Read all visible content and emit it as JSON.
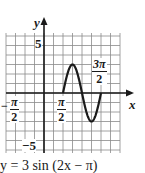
{
  "chart_data": {
    "type": "line",
    "title": "y = 3 sin (2x − π)",
    "xlabel": "x",
    "ylabel": "y",
    "function": "3*sin(2*x - pi)",
    "domain_plotted": [
      "π/2",
      "3π/2"
    ],
    "xlim": [
      "-3π/4",
      "9π/4"
    ],
    "ylim": [
      -6,
      6.5
    ],
    "grid": true,
    "grid_step_x": "π/4",
    "grid_step_y": 1,
    "x_tick_labels": [
      "-π/2",
      "π/2",
      "3π/2"
    ],
    "y_tick_labels": [
      "5",
      "-5"
    ],
    "points": [
      {
        "x": "π/2",
        "y": 0
      },
      {
        "x": "3π/4",
        "y": 3
      },
      {
        "x": "π",
        "y": 0
      },
      {
        "x": "5π/4",
        "y": -3
      },
      {
        "x": "3π/2",
        "y": 0
      }
    ],
    "amplitude": 3,
    "period": "π",
    "phase_shift": "π/2"
  },
  "axes": {
    "x_label": "x",
    "y_label": "y",
    "y_tick_pos": "5",
    "y_tick_neg": "−5",
    "x_tick_neg": {
      "num": "π",
      "den": "2",
      "sign": "−"
    },
    "x_tick_pos": {
      "num": "π",
      "den": "2"
    },
    "x_tick_3pi2": {
      "num": "3π",
      "den": "2"
    }
  },
  "caption": "y = 3 sin (2x − π)",
  "colors": {
    "ink": "#1a1a1a",
    "grid": "#8a8a8a"
  }
}
